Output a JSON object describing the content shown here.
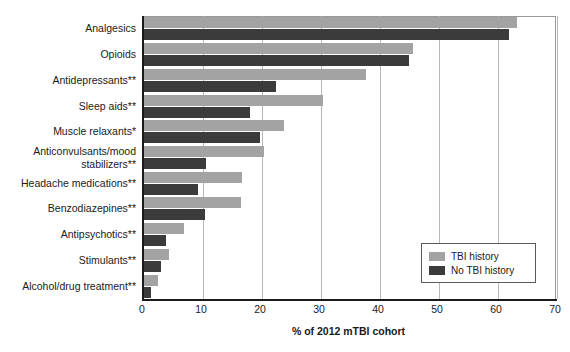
{
  "chart_data": {
    "type": "bar",
    "orientation": "horizontal",
    "title": "",
    "xlabel": "% of 2012 mTBI cohort",
    "ylabel": "",
    "xlim": [
      0,
      70
    ],
    "xticks": [
      0,
      10,
      20,
      30,
      40,
      50,
      60,
      70
    ],
    "grid": true,
    "legend_position": "lower-right",
    "categories": [
      "Analgesics",
      "Opioids",
      "Antidepressants**",
      "Sleep aids**",
      "Muscle relaxants*",
      "Anticonvulsants/mood stabilizers**",
      "Headache medications**",
      "Benzodiazepines**",
      "Antipsychotics**",
      "Stimulants**",
      "Alcohol/drug treatment**"
    ],
    "series": [
      {
        "name": "TBI history",
        "color": "#a3a3a3",
        "values": [
          63.3,
          45.6,
          37.6,
          30.3,
          23.8,
          20.4,
          16.6,
          16.5,
          6.7,
          4.3,
          2.3
        ]
      },
      {
        "name": "No TBI history",
        "color": "#3b3b3b",
        "values": [
          61.8,
          44.9,
          22.4,
          18.0,
          19.7,
          10.5,
          9.2,
          10.3,
          3.7,
          2.8,
          1.2
        ]
      }
    ]
  },
  "legend": {
    "entries": [
      {
        "label": "TBI history",
        "color": "#a3a3a3"
      },
      {
        "label": "No TBI history",
        "color": "#3b3b3b"
      }
    ]
  },
  "axis": {
    "x_title": "% of 2012 mTBI cohort",
    "x_tick_labels": [
      "0",
      "10",
      "20",
      "30",
      "40",
      "50",
      "60",
      "70"
    ]
  }
}
